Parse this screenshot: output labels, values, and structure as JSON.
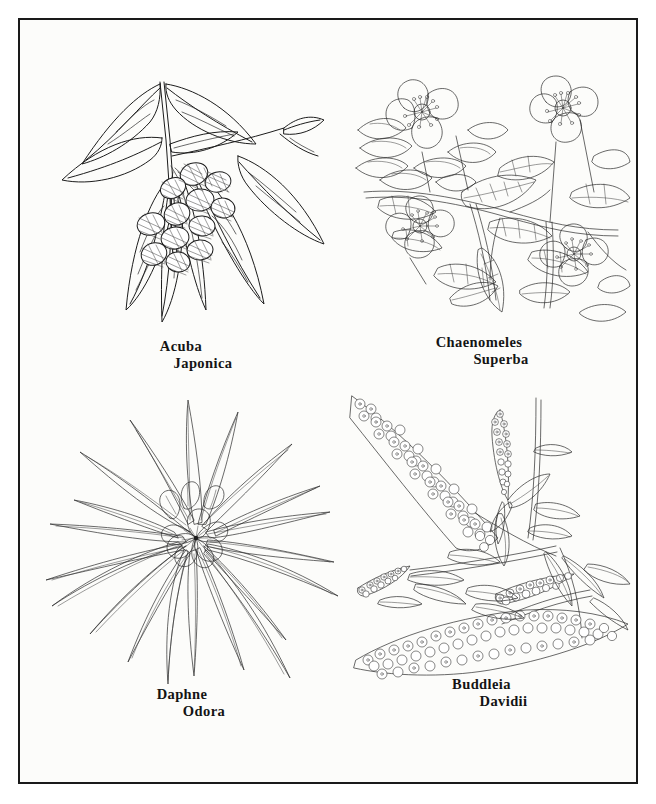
{
  "page": {
    "background_color": "#fcfcfa",
    "border_color": "#1a1a1a",
    "ink_color": "#1c1c1c",
    "layout": "2x2 grid of botanical pen-and-ink drawings inside a single ruled rectangular border"
  },
  "figures": [
    {
      "id": "acuba-japonica",
      "position": "top-left",
      "genus": "Acuba",
      "species": "Japonica",
      "subject": "branch with lanceolate leaves and a cluster of cross-hatched shaded berries",
      "style": "line drawing with cross-hatched berry shading"
    },
    {
      "id": "chaenomeles-superba",
      "position": "top-right",
      "genus": "Chaenomeles",
      "species": "Superba",
      "subject": "dense flowering quince branch with open blossoms, buds and serrated leaves",
      "style": "outline line drawing, no shading"
    },
    {
      "id": "daphne-odora",
      "position": "bottom-left",
      "genus": "Daphne",
      "species": "Odora",
      "subject": "rosette of long narrow leaves radiating from a central cluster of star-shaped flowers",
      "style": "fine outline line drawing"
    },
    {
      "id": "buddleia-davidii",
      "position": "bottom-right",
      "genus": "Buddleia",
      "species": "Davidii",
      "subject": "arching stems bearing long tapered panicles of tiny massed florets with narrow leaves",
      "style": "stippled and massed floret line drawing"
    }
  ]
}
